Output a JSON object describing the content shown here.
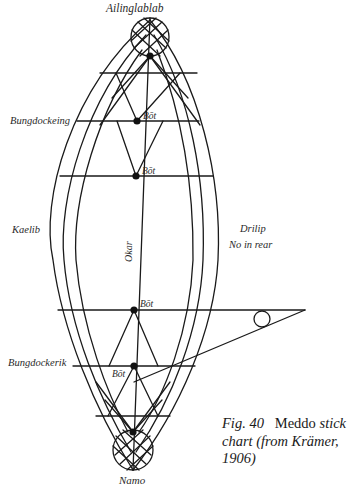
{
  "figure": {
    "caption": {
      "fig_number": "Fig. 40",
      "title_roman": "Meddo",
      "title_italic": "stick",
      "line2": "chart (from Krämer,",
      "line3": "1906)"
    },
    "labels": {
      "top_island": "Ailinglablab",
      "bottom_island": "Namo",
      "upper_left": "Bungdockeing",
      "lower_left": "Bungdockerik",
      "left_middle": "Kaelib",
      "right_middle_1": "Drilip",
      "right_middle_2": "No in rear",
      "axis": "Okar",
      "bot_1": "Bōt",
      "bot_2": "Bōt",
      "bot_3": "Bōt",
      "bot_4": "Bōt"
    },
    "colors": {
      "ink": "#1a1a1a",
      "background": "#ffffff"
    }
  }
}
